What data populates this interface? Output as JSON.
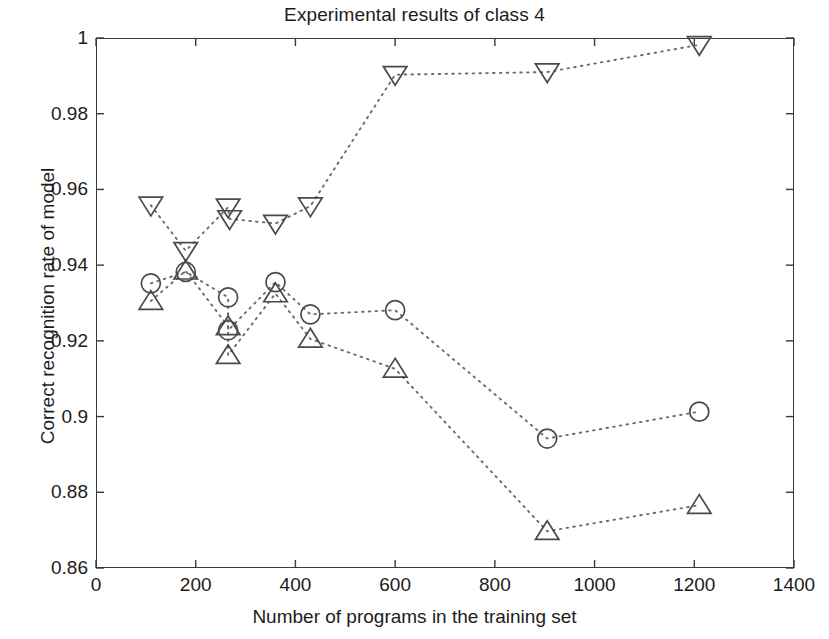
{
  "chart_data": {
    "type": "scatter",
    "title": "Experimental results of class 4",
    "xlabel": "Number of programs in the training set",
    "ylabel": "Correct recognition rate of model",
    "xlim": [
      0,
      1400
    ],
    "ylim": [
      0.86,
      1
    ],
    "xticks": [
      0,
      200,
      400,
      600,
      800,
      1000,
      1200,
      1400
    ],
    "xtick_labels": [
      "0",
      "200",
      "400",
      "600",
      "800",
      "1000",
      "1200",
      "1400"
    ],
    "yticks": [
      0.86,
      0.88,
      0.9,
      0.92,
      0.94,
      0.96,
      0.98,
      1
    ],
    "ytick_labels": [
      "0.86",
      "0.88",
      "0.9",
      "0.92",
      "0.94",
      "0.96",
      "0.98",
      "1"
    ],
    "grid": false,
    "legend": "none",
    "linestyle": "dotted",
    "color": "#4a4a4a",
    "series": [
      {
        "name": "down-triangle-series",
        "marker": "triangle-down",
        "x": [
          110,
          180,
          265,
          268,
          360,
          430,
          600,
          905,
          1210
        ],
        "y": [
          0.9558,
          0.9438,
          0.9553,
          0.9522,
          0.951,
          0.9556,
          0.9903,
          0.991,
          0.9982
        ]
      },
      {
        "name": "circle-series",
        "marker": "circle",
        "x": [
          110,
          180,
          265,
          265,
          360,
          430,
          600,
          905,
          1210
        ],
        "y": [
          0.9352,
          0.9382,
          0.9315,
          0.9228,
          0.9355,
          0.927,
          0.9281,
          0.8942,
          0.9013
        ]
      },
      {
        "name": "up-triangle-series",
        "marker": "triangle-up",
        "x": [
          110,
          180,
          265,
          265,
          360,
          430,
          600,
          905,
          1210
        ],
        "y": [
          0.9305,
          0.9385,
          0.9238,
          0.9162,
          0.9325,
          0.9205,
          0.9126,
          0.8697,
          0.8766
        ]
      }
    ]
  }
}
